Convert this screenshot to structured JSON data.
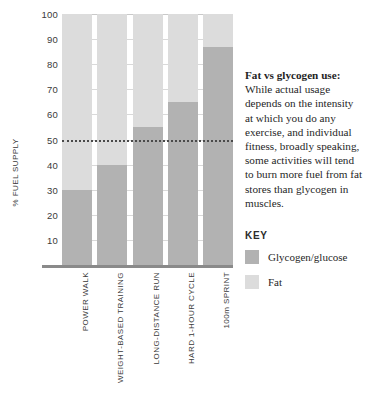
{
  "chart_data": {
    "type": "bar",
    "stacked": true,
    "title": "",
    "xlabel": "",
    "ylabel": "% FUEL SUPPLY",
    "ylim": [
      0,
      100
    ],
    "ytick_step": 10,
    "ytick_labels": [
      "100",
      "90",
      "80",
      "70",
      "60",
      "50",
      "40",
      "30",
      "20",
      "10"
    ],
    "ytick_values": [
      100,
      90,
      80,
      70,
      60,
      50,
      40,
      30,
      20,
      10
    ],
    "grid": true,
    "grid_axis": "y",
    "legend_position": "right",
    "categories": [
      "POWER WALK",
      "WEIGHT-BASED TRAINING",
      "LONG-DISTANCE RUN",
      "HARD 1-HOUR CYCLE",
      "100m SPRINT"
    ],
    "series": [
      {
        "name": "Glycogen/glucose",
        "color": "#b2b2b2",
        "values": [
          30,
          40,
          55,
          65,
          87
        ]
      },
      {
        "name": "Fat",
        "color": "#dcdcdc",
        "values": [
          70,
          60,
          45,
          35,
          13
        ]
      }
    ],
    "annotations": [
      {
        "type": "hline",
        "value": 50,
        "style": "dotted",
        "color": "#4a4a4a"
      }
    ]
  },
  "side_panel": {
    "note_heading": "Fat vs glycogen use:",
    "note_body": " While actual usage depends on the intensity at which you do any exercise, and individual fitness, broadly speaking, some activities will tend to burn more fuel from fat stores than glycogen in muscles.",
    "key_title": "KEY",
    "legend": [
      {
        "label": "Glycogen/glucose",
        "color": "#b2b2b2"
      },
      {
        "label": "Fat",
        "color": "#dcdcdc"
      }
    ]
  }
}
